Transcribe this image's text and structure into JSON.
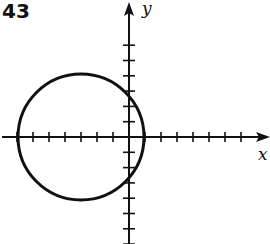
{
  "problem_number": "43",
  "axes": {
    "x_label": "x",
    "y_label": "y"
  },
  "graph": {
    "shape": "circle",
    "center": [
      -3,
      0
    ],
    "radius": 4,
    "x_ticks": [
      -7,
      -6,
      -5,
      -4,
      -3,
      -2,
      -1,
      1,
      2,
      3,
      4,
      5,
      6,
      7
    ],
    "y_ticks": [
      -7,
      -6,
      -5,
      -4,
      -3,
      -2,
      -1,
      1,
      2,
      3,
      4,
      5,
      6
    ]
  }
}
